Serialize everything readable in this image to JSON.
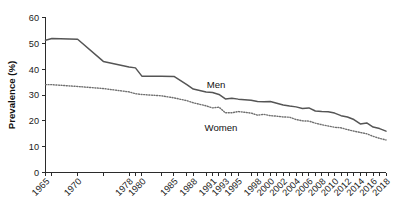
{
  "chart_data": {
    "type": "line",
    "title": "",
    "subtitle": "",
    "xlabel": "",
    "ylabel": "Prevalence (%)",
    "ylim": [
      0,
      60
    ],
    "yticks": [
      0,
      10,
      20,
      30,
      40,
      50,
      60
    ],
    "grid": false,
    "legend_position": "inline-annotation",
    "x": [
      1965,
      1966,
      1970,
      1974,
      1978,
      1979,
      1980,
      1983,
      1985,
      1987,
      1988,
      1990,
      1991,
      1992,
      1993,
      1994,
      1995,
      1997,
      1998,
      1999,
      2000,
      2001,
      2002,
      2003,
      2004,
      2005,
      2006,
      2007,
      2008,
      2009,
      2010,
      2011,
      2012,
      2013,
      2014,
      2015,
      2016,
      2017,
      2018
    ],
    "xtick_labels": [
      "1965",
      "1970",
      "1978",
      "1980",
      "1985",
      "1988",
      "1991",
      "1993",
      "1995",
      "1998",
      "2000",
      "2002",
      "2004",
      "2006",
      "2008",
      "2010",
      "2012",
      "2014",
      "2016",
      "2018"
    ],
    "series": [
      {
        "name": "Men",
        "style": "solid",
        "color": "#555555",
        "values": [
          51.2,
          51.9,
          51.6,
          43.0,
          40.8,
          40.5,
          37.3,
          37.3,
          37.2,
          34.0,
          32.3,
          31.2,
          31.0,
          30.2,
          28.5,
          28.7,
          28.4,
          28.0,
          27.5,
          27.4,
          27.5,
          26.8,
          26.1,
          25.7,
          25.4,
          24.8,
          25.0,
          23.8,
          23.6,
          23.5,
          23.0,
          22.0,
          21.5,
          20.5,
          18.8,
          19.2,
          17.6,
          17.0,
          16.0
        ]
      },
      {
        "name": "Women",
        "style": "dotted",
        "color": "#6f6f6f",
        "values": [
          34.0,
          34.0,
          33.3,
          32.5,
          31.2,
          30.5,
          30.2,
          29.7,
          28.9,
          27.8,
          27.0,
          25.8,
          25.0,
          25.3,
          23.1,
          23.1,
          23.6,
          23.0,
          22.2,
          22.5,
          22.0,
          21.8,
          21.5,
          21.4,
          20.5,
          20.0,
          19.9,
          19.1,
          18.5,
          18.0,
          17.5,
          17.3,
          16.6,
          16.0,
          15.5,
          15.0,
          14.0,
          13.2,
          12.6
        ]
      }
    ],
    "annotations": [
      {
        "text": "Men",
        "series": "Men"
      },
      {
        "text": "Women",
        "series": "Women"
      }
    ]
  }
}
